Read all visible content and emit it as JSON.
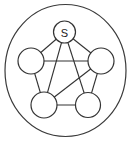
{
  "diagram": {
    "type": "graph",
    "nodes": [
      {
        "id": "s",
        "label": "S"
      },
      {
        "id": "left",
        "label": ""
      },
      {
        "id": "right",
        "label": ""
      },
      {
        "id": "bottom-left",
        "label": ""
      },
      {
        "id": "bottom-right",
        "label": ""
      }
    ],
    "edges": [
      [
        "s",
        "left"
      ],
      [
        "s",
        "right"
      ],
      [
        "s",
        "bottom-left"
      ],
      [
        "s",
        "bottom-right"
      ],
      [
        "left",
        "right"
      ],
      [
        "left",
        "bottom-left"
      ],
      [
        "right",
        "bottom-right"
      ],
      [
        "right",
        "bottom-left"
      ],
      [
        "bottom-left",
        "bottom-right"
      ]
    ],
    "enclosed_by_outer_circle": true
  }
}
